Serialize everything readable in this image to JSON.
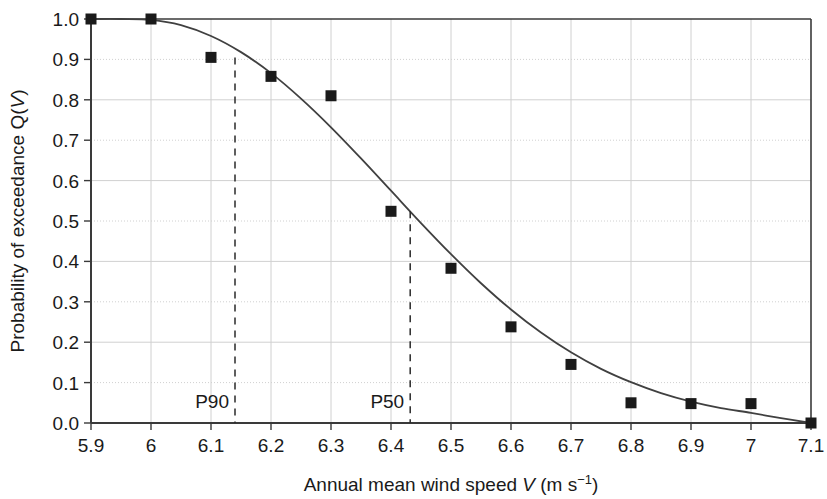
{
  "chart_data": {
    "type": "scatter",
    "title": "",
    "xlabel": "Annual mean wind speed V (m s-1)",
    "xlabel_parts": {
      "prefix": "Annual mean wind speed ",
      "variable": "V",
      "unit_open": " (m s",
      "exponent": "−1",
      "unit_close": ")"
    },
    "ylabel": "Probability of exceedance Q(V)",
    "ylabel_parts": {
      "prefix": "Probability of exceedance Q(",
      "variable": "V",
      "suffix": ")"
    },
    "xlim": [
      5.9,
      7.1
    ],
    "ylim": [
      0.0,
      1.0
    ],
    "xticks": [
      "5.9",
      "6",
      "6.1",
      "6.2",
      "6.3",
      "6.4",
      "6.5",
      "6.6",
      "6.7",
      "6.8",
      "6.9",
      "7",
      "7.1"
    ],
    "xtick_values": [
      5.9,
      6.0,
      6.1,
      6.2,
      6.3,
      6.4,
      6.5,
      6.6,
      6.7,
      6.8,
      6.9,
      7.0,
      7.1
    ],
    "yticks": [
      "0.0",
      "0.1",
      "0.2",
      "0.3",
      "0.4",
      "0.5",
      "0.6",
      "0.7",
      "0.8",
      "0.9",
      "1.0"
    ],
    "ytick_values": [
      0.0,
      0.1,
      0.2,
      0.3,
      0.4,
      0.5,
      0.6,
      0.7,
      0.8,
      0.9,
      1.0
    ],
    "grid": true,
    "legend": "none",
    "marker": "square",
    "marker_color": "#1a1a1a",
    "line_color": "#404040",
    "grid_color": "#d0d0d0",
    "axis_color": "#3a3a3a",
    "x": [
      5.9,
      6.0,
      6.1,
      6.2,
      6.3,
      6.4,
      6.5,
      6.6,
      6.7,
      6.8,
      6.9,
      7.0,
      7.1
    ],
    "values": [
      1.0,
      1.0,
      0.905,
      0.858,
      0.81,
      0.524,
      0.383,
      0.238,
      0.145,
      0.05,
      0.048,
      0.048,
      0.0
    ],
    "series": [
      {
        "name": "Observed exceedance probability",
        "type": "scatter",
        "values": [
          1.0,
          1.0,
          0.905,
          0.858,
          0.81,
          0.524,
          0.383,
          0.238,
          0.145,
          0.05,
          0.048,
          0.048,
          0.0
        ]
      },
      {
        "name": "Fitted exceedance curve",
        "type": "line",
        "x": [
          5.9,
          5.95,
          6.0,
          6.05,
          6.1,
          6.15,
          6.2,
          6.25,
          6.3,
          6.35,
          6.4,
          6.45,
          6.5,
          6.55,
          6.6,
          6.65,
          6.7,
          6.75,
          6.8,
          6.85,
          6.9,
          6.95,
          7.0,
          7.05,
          7.1
        ],
        "values": [
          1.0,
          1.0,
          0.998,
          0.985,
          0.958,
          0.918,
          0.866,
          0.803,
          0.732,
          0.655,
          0.575,
          0.495,
          0.418,
          0.346,
          0.281,
          0.224,
          0.175,
          0.134,
          0.101,
          0.074,
          0.053,
          0.037,
          0.025,
          0.012,
          0.0
        ]
      }
    ],
    "annotations": [
      {
        "label": "P90",
        "x": 6.14,
        "y_top": 0.905,
        "y_bottom": 0.0,
        "style": "dashed-vertical"
      },
      {
        "label": "P50",
        "x": 6.432,
        "y_top": 0.524,
        "y_bottom": 0.0,
        "style": "dashed-vertical"
      }
    ]
  }
}
